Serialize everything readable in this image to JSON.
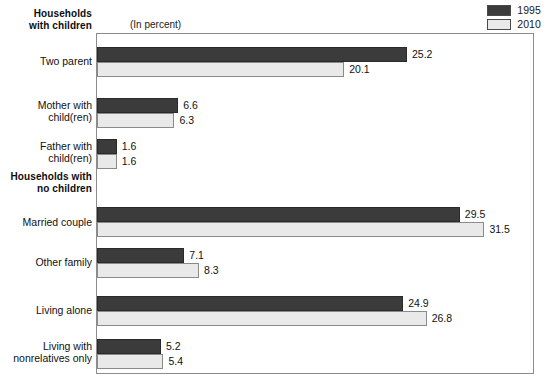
{
  "legend": {
    "items": [
      {
        "label": "1995",
        "color": "#3b3b3b",
        "name": "legend-swatch-1995"
      },
      {
        "label": "2010",
        "color": "#e9e9e9",
        "name": "legend-swatch-2010"
      }
    ]
  },
  "units_note": "(In percent)",
  "sections": [
    {
      "label": "Households\nwith children"
    },
    {
      "label": "Households with\nno children"
    }
  ],
  "chart_data": {
    "type": "bar",
    "orientation": "horizontal",
    "title": "",
    "subtitle": "(In percent)",
    "xlabel": "",
    "ylabel": "",
    "xlim": [
      0,
      35.6
    ],
    "grid": false,
    "legend_position": "top-right",
    "categories": [
      "Two parent",
      "Mother with\nchild(ren)",
      "Father with\nchild(ren)",
      "Married couple",
      "Other family",
      "Living alone",
      "Living with\nnonrelatives only"
    ],
    "group_headers": [
      {
        "label": "Households\nwith children",
        "before_category_index": 0
      },
      {
        "label": "Households with\nno children",
        "before_category_index": 3
      }
    ],
    "series": [
      {
        "name": "1995",
        "color": "#3b3b3b",
        "values": [
          25.2,
          6.6,
          1.6,
          29.5,
          7.1,
          24.9,
          5.2
        ]
      },
      {
        "name": "2010",
        "color": "#e9e9e9",
        "values": [
          20.1,
          6.3,
          1.6,
          31.5,
          8.3,
          26.8,
          5.4
        ]
      }
    ],
    "data_labels": {
      "1995": [
        "25.2",
        "6.6",
        "1.6",
        "29.5",
        "7.1",
        "24.9",
        "5.2"
      ],
      "2010": [
        "20.1",
        "6.3",
        "1.6",
        "31.5",
        "8.3",
        "26.8",
        "5.4"
      ]
    }
  },
  "rows": [
    {
      "label": "Two parent",
      "label_top": 55,
      "group_top": 47,
      "v1995": 25.2,
      "v2010": 20.1,
      "l1995": "25.2",
      "l2010": "20.1"
    },
    {
      "label": "Mother with\nchild(ren)",
      "label_top": 99,
      "group_top": 98,
      "v1995": 6.6,
      "v2010": 6.3,
      "l1995": "6.6",
      "l2010": "6.3"
    },
    {
      "label": "Father with\nchild(ren)",
      "label_top": 140,
      "group_top": 139,
      "v1995": 1.6,
      "v2010": 1.6,
      "l1995": "1.6",
      "l2010": "1.6"
    },
    {
      "label": "Married couple",
      "label_top": 216,
      "group_top": 207,
      "v1995": 29.5,
      "v2010": 31.5,
      "l1995": "29.5",
      "l2010": "31.5"
    },
    {
      "label": "Other family",
      "label_top": 256,
      "group_top": 248,
      "v1995": 7.1,
      "v2010": 8.3,
      "l1995": "7.1",
      "l2010": "8.3"
    },
    {
      "label": "Living alone",
      "label_top": 304,
      "group_top": 296,
      "v1995": 24.9,
      "v2010": 26.8,
      "l1995": "24.9",
      "l2010": "26.8"
    },
    {
      "label": "Living with\nnonrelatives only",
      "label_top": 340,
      "group_top": 339,
      "v1995": 5.2,
      "v2010": 5.4,
      "l1995": "5.2",
      "l2010": "5.4"
    }
  ],
  "scale": {
    "px_per_unit": 12.3
  }
}
